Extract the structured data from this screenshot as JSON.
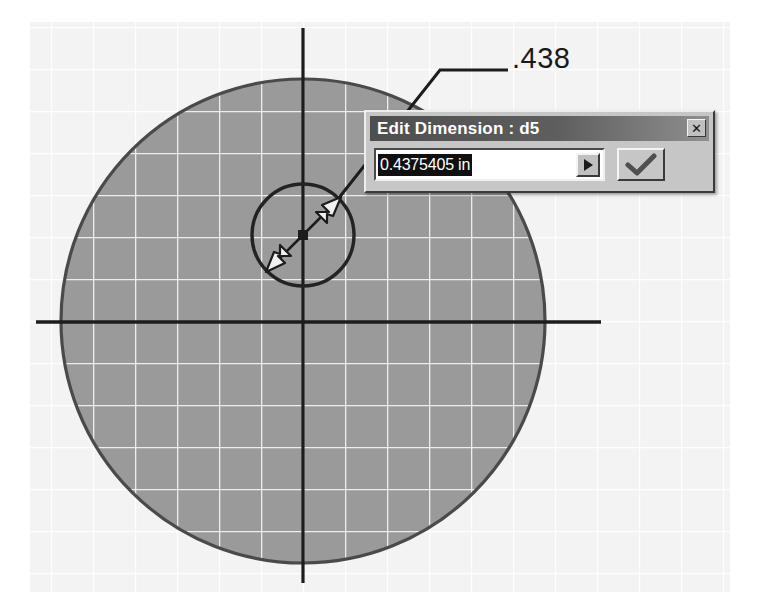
{
  "app": {
    "name": "CAD sketch editor",
    "view": "2D sketch with dimension edit"
  },
  "sketch": {
    "background_color": "#ffffff",
    "grid_color": "#e8e8e8",
    "grid_spacing_px": 42,
    "fill_color": "#999999",
    "fill_grid_color": "#f2f2f2",
    "outline_color": "#2b2b2b",
    "axis_color": "#1a1a1a",
    "large_circle": {
      "name": "outer-circle",
      "center_x": 303,
      "center_y": 321,
      "radius": 242
    },
    "small_circle": {
      "name": "inner-circle",
      "center_x": 303,
      "center_y": 235,
      "radius": 51
    },
    "dimension_leader": {
      "arrow_tip_x": 264,
      "arrow_tip_y": 274,
      "elbow_x": 440,
      "elbow_y": 70,
      "end_x": 508,
      "end_y": 70
    },
    "diameter_arrow": {
      "from_x": 267,
      "from_y": 271,
      "to_x": 340,
      "to_y": 198,
      "center_marker_x": 303,
      "center_marker_y": 235
    }
  },
  "callout": {
    "label": ".438"
  },
  "dialog": {
    "title": "Edit Dimension : d5",
    "close_glyph": "✕",
    "close_tooltip": "Close",
    "value": "0.4375405 in",
    "value_placeholder": "0.0000 in",
    "value_selected": true,
    "dropdown_glyph": "▶",
    "accept_glyph": "✓",
    "titlebar_color": "#5a5a5a",
    "face_color": "#c6c6c6"
  }
}
